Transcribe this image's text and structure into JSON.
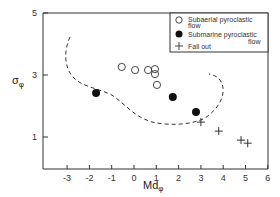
{
  "chart_data": {
    "type": "scatter",
    "title": "",
    "xlabel": "Mdφ",
    "ylabel": "σφ",
    "xlim": [
      -4,
      6
    ],
    "ylim": [
      0,
      5
    ],
    "x_ticks": [
      "-3",
      "-2",
      "-1",
      "0",
      "1",
      "2",
      "3",
      "4",
      "5",
      "6"
    ],
    "y_ticks": [
      "1",
      "3",
      "5"
    ],
    "grid": false,
    "legend_position": "upper right",
    "series": [
      {
        "name": "Subaerial pyroclastic flow",
        "marker": "open-circle",
        "points": [
          [
            -0.55,
            3.26
          ],
          [
            0.05,
            3.16
          ],
          [
            0.63,
            3.16
          ],
          [
            0.94,
            3.19
          ],
          [
            0.94,
            3.03
          ],
          [
            1.03,
            2.68
          ]
        ]
      },
      {
        "name": "Submarine pyroclastic flow",
        "marker": "filled-circle",
        "points": [
          [
            -1.7,
            2.42
          ],
          [
            1.74,
            2.29
          ],
          [
            2.78,
            1.81
          ]
        ]
      },
      {
        "name": "Fall out",
        "marker": "plus",
        "points": [
          [
            3.0,
            1.48
          ],
          [
            3.8,
            1.19
          ],
          [
            4.8,
            0.9
          ],
          [
            5.1,
            0.8
          ]
        ]
      }
    ],
    "annotations": [
      "Dashed boundary curve enclosing pyroclastic flow field"
    ]
  },
  "legend": {
    "items": [
      {
        "label_line1": "Subaerial pyroclastic",
        "label_line2": "flow"
      },
      {
        "label_line1": "Submarine pyroclastic",
        "label_line2": "flow"
      },
      {
        "label_line1": "Fall out",
        "label_line2": ""
      }
    ]
  },
  "axes": {
    "x_label_main": "Md",
    "x_label_sub": "φ",
    "y_label_main": "σ",
    "y_label_sub": "φ"
  }
}
